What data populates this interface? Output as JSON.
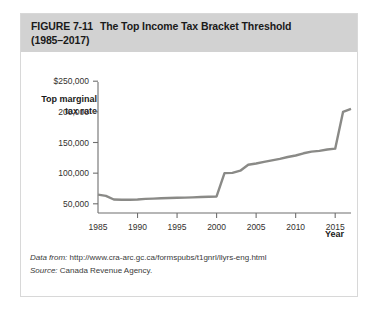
{
  "figure": {
    "label": "FIGURE  7-11",
    "title_line1": "The Top Income Tax Bracket Threshold",
    "title_line2": "(1985–2017)"
  },
  "axis": {
    "y_title_line1": "Top marginal",
    "y_title_line2": "tax rate",
    "x_title": "Year"
  },
  "source": {
    "data_from_label": "Data from:",
    "data_from_value": "http://www.cra-arc.gc.ca/formspubs/t1gnrl/llyrs-eng.html",
    "source_label": "Source:",
    "source_value": "Canada Revenue Agency."
  },
  "colors": {
    "line": "#8a8a87",
    "axis": "#6f6f6f",
    "header_band": "#d2d2d2",
    "card_border": "#d8d8d8"
  },
  "chart_data": {
    "type": "line",
    "title": "The Top Income Tax Bracket Threshold (1985–2017)",
    "xlabel": "Year",
    "ylabel": "Top marginal tax rate",
    "xlim": [
      1985,
      2017
    ],
    "ylim": [
      35000,
      265000
    ],
    "grid": false,
    "legend": "none",
    "ytick_values": [
      250000,
      200000,
      150000,
      100000,
      50000
    ],
    "ytick_labels": [
      "$250,000",
      "200,000",
      "150,000",
      "100,000",
      "50,000"
    ],
    "xtick_values": [
      1985,
      1990,
      1995,
      2000,
      2005,
      2010,
      2015
    ],
    "xtick_labels": [
      "1985",
      "1990",
      "1995",
      "2000",
      "2005",
      "2010",
      "2015"
    ],
    "series": [
      {
        "name": "Top income tax bracket threshold",
        "x": [
          1985,
          1986,
          1987,
          1988,
          1989,
          1990,
          1991,
          1992,
          1993,
          1994,
          1995,
          1996,
          1997,
          1998,
          1999,
          2000,
          2001,
          2002,
          2003,
          2004,
          2005,
          2006,
          2007,
          2008,
          2009,
          2010,
          2011,
          2012,
          2013,
          2014,
          2015,
          2016,
          2017
        ],
        "values": [
          65000,
          63000,
          57000,
          56500,
          56500,
          57000,
          58000,
          58500,
          59000,
          59500,
          59800,
          60000,
          60500,
          61000,
          61500,
          62000,
          100000,
          100500,
          104000,
          113800,
          115700,
          118300,
          120900,
          123200,
          126300,
          128800,
          132400,
          135100,
          136300,
          138600,
          140000,
          200000,
          205000
        ]
      }
    ]
  }
}
